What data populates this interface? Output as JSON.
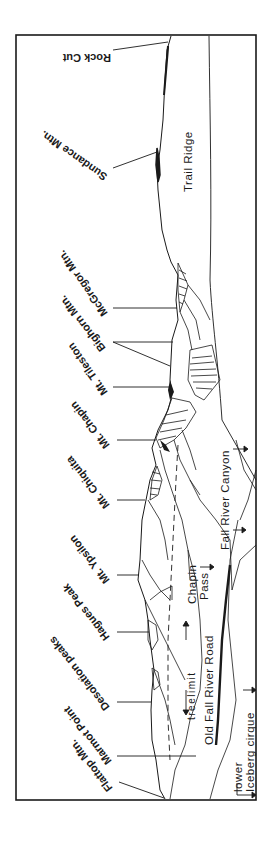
{
  "figure": {
    "type": "panoramic-landscape-sketch",
    "orientation": "rotated-90",
    "ridge_labels": [
      {
        "id": "rock-cut",
        "text": "Rock Cut",
        "leader_y": 50
      },
      {
        "id": "sundance",
        "text": "Sundance Mtn.",
        "leader_y": 168
      },
      {
        "id": "mcgregor",
        "text": "McGregor Mtn.",
        "leader_y": 308
      },
      {
        "id": "bighorn",
        "text": "Bighorn Mtn.",
        "leader_y": 342
      },
      {
        "id": "tileston",
        "text": "Mt. Tileston",
        "leader_y": 387
      },
      {
        "id": "chapin",
        "text": "Mt. Chapin",
        "leader_y": 440
      },
      {
        "id": "chiquita",
        "text": "Mt. Chiquita",
        "leader_y": 500
      },
      {
        "id": "ypsilon",
        "text": "Mt. Ypsilon",
        "leader_y": 575
      },
      {
        "id": "hagues",
        "text": "Hagues Peak",
        "leader_y": 632
      },
      {
        "id": "desolation",
        "text": "Desolation   peaks",
        "leader_y": 702
      },
      {
        "id": "marmot",
        "text": "Marmot Point",
        "leader_y": 756
      },
      {
        "id": "flattop",
        "text": "Flattop Mtn.",
        "leader_y": 782
      }
    ],
    "interior_labels": {
      "trail_ridge": "Trail Ridge",
      "fall_river_canyon": "Fall River Canyon",
      "chapin_pass_line1": "Chapin",
      "chapin_pass_line2": "Pass",
      "treelimit": "treelimit",
      "old_fall_river_road": "Old  Fall  River  Road",
      "lower_line1": "lower",
      "iceberg_cirque": "Iceberg  cirque"
    },
    "colors": {
      "ink": "#1a1a1a",
      "paper": "#ffffff"
    }
  }
}
